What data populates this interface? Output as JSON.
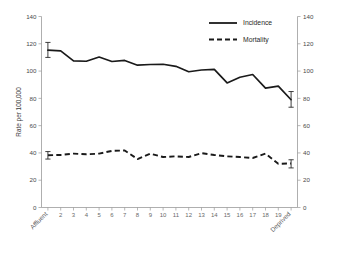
{
  "chart_data": {
    "type": "line",
    "title": "",
    "xlabel": "",
    "ylabel": "Rate per 100,000",
    "ylabel_right": "",
    "ylim": [
      0,
      140
    ],
    "ytick_labels": [
      "140",
      "120",
      "100",
      "80",
      "60",
      "40",
      "20",
      "0"
    ],
    "ytick_values": [
      140,
      120,
      100,
      80,
      60,
      40,
      20,
      0
    ],
    "ytick_labels_right": [
      "140",
      "120",
      "100",
      "80",
      "60",
      "40",
      "20",
      "0"
    ],
    "grid": false,
    "legend_position": "top-right",
    "x": [
      1,
      2,
      3,
      4,
      5,
      6,
      7,
      8,
      9,
      10,
      11,
      12,
      13,
      14,
      15,
      16,
      17,
      18,
      19,
      20
    ],
    "categories": [
      "Affluent",
      "2",
      "3",
      "4",
      "5",
      "6",
      "7",
      "8",
      "9",
      "10",
      "11",
      "12",
      "13",
      "14",
      "15",
      "16",
      "17",
      "18",
      "19",
      "Deprived"
    ],
    "xtick_labels": [
      "Affluent",
      "2",
      "3",
      "4",
      "5",
      "6",
      "7",
      "8",
      "9",
      "10",
      "11",
      "12",
      "13",
      "14",
      "15",
      "16",
      "17",
      "18",
      "19",
      "Deprived"
    ],
    "x_first_label": "Affluent",
    "x_last_label": "Deprived",
    "series": [
      {
        "name": "Incidence",
        "style": "solid",
        "color": "#1a1a1a",
        "values": [
          115.3,
          114.8,
          107.5,
          107.2,
          110.3,
          107.0,
          107.8,
          104.3,
          104.8,
          105.0,
          103.5,
          99.5,
          100.8,
          101.3,
          91.3,
          95.5,
          97.5,
          87.5,
          89.0,
          79.0
        ],
        "error_bars": [
          {
            "index": 0,
            "value": 115.3,
            "low": 110.0,
            "high": 121.0
          },
          {
            "index": 19,
            "value": 79.0,
            "low": 73.5,
            "high": 85.0
          }
        ]
      },
      {
        "name": "Mortality",
        "style": "dashed",
        "color": "#1a1a1a",
        "values": [
          38.3,
          38.5,
          39.5,
          39.0,
          39.5,
          41.5,
          41.8,
          35.5,
          39.5,
          37.0,
          37.5,
          37.0,
          39.8,
          38.5,
          37.5,
          37.0,
          36.3,
          39.5,
          32.0,
          32.3
        ],
        "error_bars": [
          {
            "index": 0,
            "value": 38.3,
            "low": 35.5,
            "high": 41.0
          },
          {
            "index": 19,
            "value": 32.3,
            "low": 29.0,
            "high": 35.0
          }
        ]
      }
    ],
    "legend": [
      {
        "label": "Incidence",
        "style": "solid"
      },
      {
        "label": "Mortality",
        "style": "dashed"
      }
    ]
  }
}
